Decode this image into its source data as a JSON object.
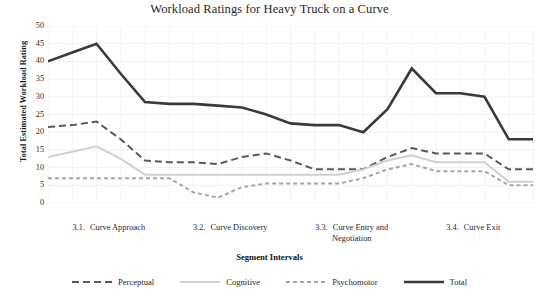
{
  "chart_data": {
    "type": "line",
    "title": "Workload Ratings for Heavy Truck on a Curve",
    "xlabel": "Segment Intervals",
    "ylabel": "Total Estimated Workload Rating",
    "ylim": [
      0,
      50
    ],
    "ytick_step": 5,
    "yticks": [
      50,
      45,
      40,
      35,
      30,
      25,
      20,
      15,
      10,
      5,
      0
    ],
    "grid": true,
    "legend_position": "bottom",
    "x_groups": [
      {
        "number": "3.1.",
        "label": "Curve Approach"
      },
      {
        "number": "3.2.",
        "label": "Curve Discovery"
      },
      {
        "number": "3.3.",
        "label": "Curve Entry and",
        "label2": "Negotiation"
      },
      {
        "number": "3.4.",
        "label": "Curve Exit"
      }
    ],
    "x": [
      1,
      2,
      3,
      4,
      5,
      6,
      7,
      8,
      9,
      10,
      11,
      12,
      13,
      14,
      15,
      16,
      17,
      18,
      19,
      20,
      21
    ],
    "series": [
      {
        "name": "Perceptual",
        "color": "#595959",
        "width": 2.0,
        "dash": "7,4",
        "values": [
          21.5,
          22.0,
          23.0,
          18.0,
          12.0,
          11.5,
          11.5,
          11.0,
          13.0,
          14.0,
          12.0,
          9.5,
          9.5,
          9.5,
          13.0,
          15.5,
          14.0,
          14.0,
          14.0,
          9.5,
          9.5
        ]
      },
      {
        "name": "Cognitive",
        "color": "#d0d0d0",
        "width": 2.0,
        "dash": "0",
        "values": [
          13.0,
          14.5,
          16.0,
          12.5,
          8.0,
          8.0,
          8.0,
          8.0,
          8.0,
          8.0,
          8.0,
          8.0,
          8.0,
          9.5,
          12.0,
          13.5,
          11.5,
          11.5,
          11.5,
          6.0,
          6.0
        ]
      },
      {
        "name": "Psychomotor",
        "color": "#a6a6a6",
        "width": 2.0,
        "dash": "4,3",
        "values": [
          7.0,
          7.0,
          7.0,
          7.0,
          7.0,
          7.0,
          3.0,
          1.5,
          4.5,
          5.5,
          5.5,
          5.5,
          5.5,
          7.0,
          9.5,
          11.0,
          9.0,
          9.0,
          9.0,
          5.0,
          5.0
        ]
      },
      {
        "name": "Total",
        "color": "#3a3a3a",
        "width": 2.6,
        "dash": "0",
        "values": [
          40.0,
          42.5,
          45.0,
          36.5,
          28.5,
          28.0,
          28.0,
          27.5,
          27.0,
          25.0,
          22.5,
          22.0,
          22.0,
          20.0,
          26.5,
          38.0,
          31.0,
          31.0,
          30.0,
          18.0,
          18.0
        ]
      }
    ]
  }
}
